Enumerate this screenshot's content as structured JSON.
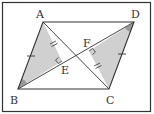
{
  "figure": {
    "frame": {
      "x": 2.5,
      "y": 2.5,
      "w": 147,
      "h": 109
    },
    "colors": {
      "line": "#333333",
      "shade": "#d0d0d0",
      "angle_mark": "#999999",
      "label": "#333333"
    },
    "points": {
      "A": {
        "x": 43,
        "y": 22,
        "label": "A"
      },
      "B": {
        "x": 18,
        "y": 89,
        "label": "B"
      },
      "C": {
        "x": 109,
        "y": 89,
        "label": "C"
      },
      "D": {
        "x": 134,
        "y": 22,
        "label": "D"
      },
      "E": {
        "x": 62,
        "y": 61,
        "label": "E"
      },
      "F": {
        "x": 89,
        "y": 51,
        "label": "F"
      }
    },
    "labels": {
      "A": "A",
      "B": "B",
      "C": "C",
      "D": "D",
      "E": "E",
      "F": "F"
    },
    "shaded_triangles": [
      "ABE",
      "CDF"
    ],
    "segments": [
      "AB",
      "BC",
      "CD",
      "DA",
      "AC",
      "BD",
      "AE",
      "CF"
    ],
    "right_angles": [
      "AEB",
      "CFD"
    ],
    "equal_marks": {
      "single": [
        "AB",
        "CD"
      ],
      "double": [
        "AE",
        "CF"
      ]
    }
  }
}
